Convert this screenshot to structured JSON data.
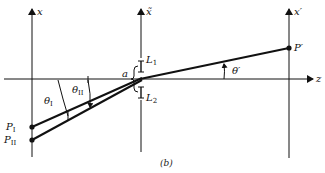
{
  "figure": {
    "caption": "(b)",
    "axes": {
      "left_vertical": "x",
      "middle_vertical": "x̃",
      "right_vertical": "x′",
      "horizontal": "z"
    },
    "points": {
      "p1": {
        "base": "P",
        "sub": "I"
      },
      "p2": {
        "base": "P",
        "sub": "II"
      },
      "p_prime": "P′"
    },
    "apertures": {
      "upper": {
        "base": "L",
        "sub": "1"
      },
      "lower": {
        "base": "L",
        "sub": "2"
      },
      "gap": "a"
    },
    "angles": {
      "theta_1": {
        "base": "θ",
        "sub": "I"
      },
      "theta_2": {
        "base": "θ",
        "sub": "II"
      },
      "theta_prime": "θ′"
    }
  }
}
